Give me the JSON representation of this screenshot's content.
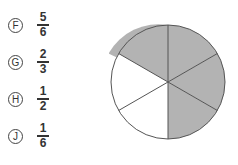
{
  "choices": [
    {
      "letter": "F",
      "numerator": "5",
      "denominator": "6"
    },
    {
      "letter": "G",
      "numerator": "2",
      "denominator": "3"
    },
    {
      "letter": "H",
      "numerator": "1",
      "denominator": "2"
    },
    {
      "letter": "J",
      "numerator": "1",
      "denominator": "6"
    }
  ],
  "pie": {
    "sectors": 6,
    "shaded_sectors": 4,
    "shaded_color": "#b3b3b3",
    "unshaded_color": "#ffffff",
    "line_color": "#555555"
  }
}
